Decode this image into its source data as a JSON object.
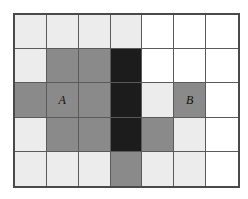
{
  "diagram": {
    "type": "grid",
    "columns": 7,
    "rows": 5,
    "palette": {
      "white": "#ffffff",
      "light": "#ececec",
      "gray": "#8a8a8a",
      "black": "#1c1c1c",
      "gridline": "#5a5a5a",
      "border": "#4a4a4a",
      "label_color": "#111111"
    },
    "cells": [
      [
        {
          "shade": "light",
          "label": ""
        },
        {
          "shade": "light",
          "label": ""
        },
        {
          "shade": "light",
          "label": ""
        },
        {
          "shade": "light",
          "label": ""
        },
        {
          "shade": "white",
          "label": ""
        },
        {
          "shade": "white",
          "label": ""
        },
        {
          "shade": "white",
          "label": ""
        }
      ],
      [
        {
          "shade": "light",
          "label": ""
        },
        {
          "shade": "gray",
          "label": ""
        },
        {
          "shade": "gray",
          "label": ""
        },
        {
          "shade": "black",
          "label": ""
        },
        {
          "shade": "white",
          "label": ""
        },
        {
          "shade": "white",
          "label": ""
        },
        {
          "shade": "white",
          "label": ""
        }
      ],
      [
        {
          "shade": "gray",
          "label": ""
        },
        {
          "shade": "gray",
          "label": "A"
        },
        {
          "shade": "gray",
          "label": ""
        },
        {
          "shade": "black",
          "label": ""
        },
        {
          "shade": "light",
          "label": ""
        },
        {
          "shade": "gray",
          "label": "B"
        },
        {
          "shade": "white",
          "label": ""
        }
      ],
      [
        {
          "shade": "light",
          "label": ""
        },
        {
          "shade": "gray",
          "label": ""
        },
        {
          "shade": "gray",
          "label": ""
        },
        {
          "shade": "black",
          "label": ""
        },
        {
          "shade": "gray",
          "label": ""
        },
        {
          "shade": "light",
          "label": ""
        },
        {
          "shade": "white",
          "label": ""
        }
      ],
      [
        {
          "shade": "light",
          "label": ""
        },
        {
          "shade": "light",
          "label": ""
        },
        {
          "shade": "light",
          "label": ""
        },
        {
          "shade": "gray",
          "label": ""
        },
        {
          "shade": "light",
          "label": ""
        },
        {
          "shade": "light",
          "label": ""
        },
        {
          "shade": "white",
          "label": ""
        }
      ]
    ]
  }
}
